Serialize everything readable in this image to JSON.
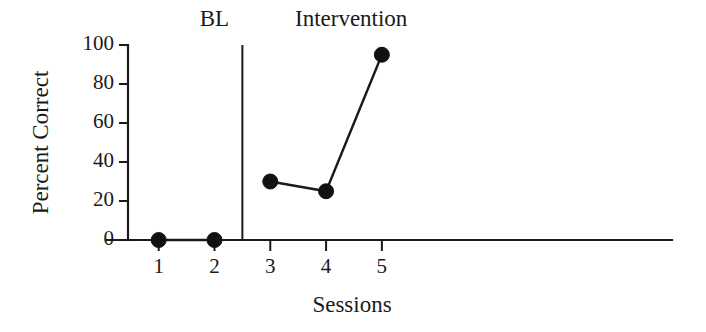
{
  "chart_data": {
    "type": "line",
    "title": "",
    "xlabel": "Sessions",
    "ylabel": "Percent Correct",
    "x": [
      1,
      2,
      3,
      4,
      5
    ],
    "xlim": [
      0.45,
      10.2
    ],
    "ylim": [
      0,
      100
    ],
    "xticks": [
      "1",
      "2",
      "3",
      "4",
      "5"
    ],
    "yticks": [
      "0",
      "20",
      "40",
      "60",
      "80",
      "100"
    ],
    "ytick_values": [
      0,
      20,
      40,
      60,
      80,
      100
    ],
    "grid": false,
    "legend": "none",
    "marker": "filled-circle",
    "marker_color": "#111111",
    "line_color": "#1a1a1a",
    "series": [
      {
        "name": "Baseline",
        "phase": "BL",
        "x": [
          1,
          2
        ],
        "values": [
          0,
          0
        ]
      },
      {
        "name": "Intervention",
        "phase": "Intervention",
        "x": [
          3,
          4,
          5
        ],
        "values": [
          30,
          25,
          95
        ]
      }
    ],
    "phases": [
      {
        "id": "bl",
        "label": "BL",
        "label_x": 2.0,
        "start_x": 0.7,
        "end_x": 2.5
      },
      {
        "id": "intervention",
        "label": "Intervention",
        "label_x": 4.45,
        "start_x": 2.5,
        "end_x": 10.2
      }
    ],
    "phase_change_line": {
      "x": 2.5
    },
    "annotations": []
  },
  "axis": {
    "y_title": "Percent Correct",
    "x_title": "Sessions"
  },
  "ticks": {
    "y": [
      "0",
      "20",
      "40",
      "60",
      "80",
      "100"
    ],
    "x": [
      "1",
      "2",
      "3",
      "4",
      "5"
    ]
  },
  "phase_labels": {
    "baseline": "BL",
    "intervention": "Intervention"
  }
}
